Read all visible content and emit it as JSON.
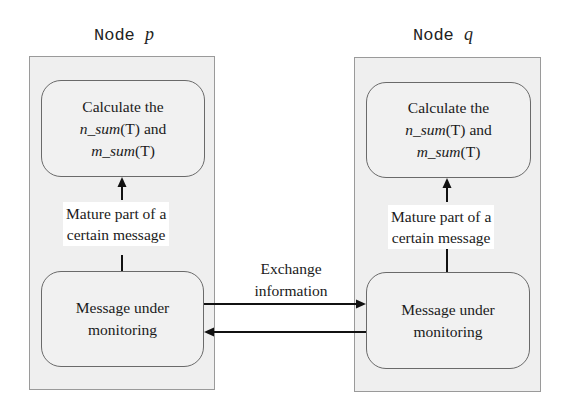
{
  "nodes": [
    {
      "title_prefix": "Node",
      "title_var": "p",
      "top_box": {
        "line1": "Calculate the",
        "n_sum": "n_sum",
        "n_arg": "(T)",
        "and": " and",
        "m_sum": "m_sum",
        "m_arg": "(T)"
      },
      "label_line1": "Mature part of a",
      "label_line2": "certain message",
      "bottom_box": {
        "line1": "Message under",
        "line2": "monitoring"
      }
    },
    {
      "title_prefix": "Node",
      "title_var": "q",
      "top_box": {
        "line1": "Calculate the",
        "n_sum": "n_sum",
        "n_arg": "(T)",
        "and": " and",
        "m_sum": "m_sum",
        "m_arg": "(T)"
      },
      "label_line1": "Mature part of a",
      "label_line2": "certain message",
      "bottom_box": {
        "line1": "Message under",
        "line2": "monitoring"
      }
    }
  ],
  "exchange": {
    "line1": "Exchange",
    "line2": "information"
  },
  "colors": {
    "panel_fill": "#efefef",
    "panel_border": "#9a9a9a",
    "box_border": "#6a6a6a",
    "arrow": "#111111"
  }
}
